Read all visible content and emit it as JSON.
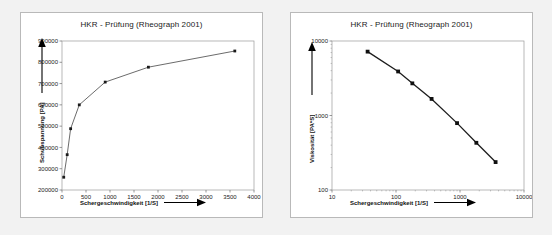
{
  "page": {
    "background_color": "#f2f2f2",
    "panel_background": "#ffffff",
    "panel_border_color": "#b9b9b9"
  },
  "panels": [
    {
      "id": "left",
      "title": "HKR - Prüfung (Rheograph 2001)",
      "x_axis_title": "Schergeschwindigkeit [1/S]",
      "y_axis_title": "Schubspannung [PA]",
      "x_ticks": [
        "0",
        "500",
        "1000",
        "1500",
        "2000",
        "2500",
        "3000",
        "3500",
        "4000"
      ],
      "y_ticks": [
        "200000",
        "300000",
        "400000",
        "500000",
        "600000",
        "700000",
        "800000",
        "900000"
      ]
    },
    {
      "id": "right",
      "title": "HKR - Prüfung (Rheograph 2001)",
      "x_axis_title": "Schergeschwindigkeit [1/S]",
      "y_axis_title": "Viskosität [PA*S]",
      "x_ticks": [
        "10",
        "100",
        "1000",
        "10000"
      ],
      "y_ticks": [
        "100",
        "1000",
        "10000"
      ]
    }
  ],
  "chart_data": [
    {
      "type": "line",
      "title": "HKR - Prüfung (Rheograph 2001)",
      "xlabel": "Schergeschwindigkeit [1/S]",
      "ylabel": "Schubspannung [PA]",
      "xscale": "linear",
      "yscale": "linear",
      "xlim": [
        0,
        4000
      ],
      "ylim": [
        200000,
        900000
      ],
      "xticks": [
        0,
        500,
        1000,
        1500,
        2000,
        2500,
        3000,
        3500,
        4000
      ],
      "yticks": [
        200000,
        300000,
        400000,
        500000,
        600000,
        700000,
        800000,
        900000
      ],
      "grid": false,
      "legend": "none",
      "marker": "square",
      "series": [
        {
          "name": "Schubspannung",
          "x": [
            36,
            108,
            180,
            360,
            900,
            1800,
            3600
          ],
          "y": [
            260000,
            366000,
            488000,
            600000,
            707000,
            777000,
            853000
          ]
        }
      ]
    },
    {
      "type": "line",
      "title": "HKR - Prüfung (Rheograph 2001)",
      "xlabel": "Schergeschwindigkeit [1/S]",
      "ylabel": "Viskosität [PA*S]",
      "xscale": "log",
      "yscale": "log",
      "xlim": [
        10,
        10000
      ],
      "ylim": [
        100,
        10000
      ],
      "xticks": [
        10,
        100,
        1000,
        10000
      ],
      "yticks": [
        100,
        1000,
        10000
      ],
      "grid": false,
      "legend": "none",
      "marker": "square",
      "series": [
        {
          "name": "Viskosität",
          "x": [
            36,
            108,
            180,
            360,
            900,
            1800,
            3600
          ],
          "y": [
            7200,
            3900,
            2700,
            1670,
            790,
            430,
            237
          ]
        }
      ]
    }
  ]
}
